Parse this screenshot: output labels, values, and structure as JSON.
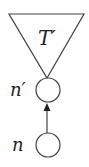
{
  "diagram": {
    "subtree": {
      "label": "T′"
    },
    "nodes": [
      {
        "id": "n_prime",
        "label": "n′"
      },
      {
        "id": "n",
        "label": "n"
      }
    ],
    "edges": [
      {
        "from": "n",
        "to": "n_prime",
        "type": "arrow"
      }
    ],
    "stroke_color": "#444444"
  }
}
